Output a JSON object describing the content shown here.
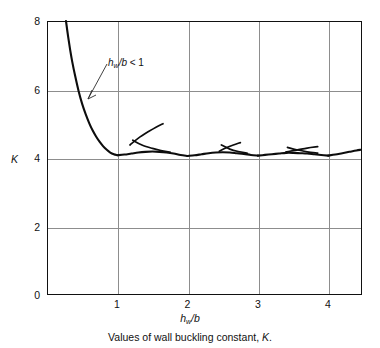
{
  "caption": {
    "prefix": "Values of wall buckling constant, ",
    "symbol": "K",
    "suffix": "."
  },
  "axes": {
    "y_title": "K",
    "x_title_main": "h",
    "x_title_sub": "w",
    "x_title_rest": "/b",
    "y_ticks": [
      "0",
      "2",
      "4",
      "6",
      "8"
    ],
    "x_ticks": [
      "1",
      "2",
      "3",
      "4"
    ]
  },
  "annotation": {
    "main": "h",
    "sub": "w",
    "rest": "/b",
    "relation": " < 1"
  },
  "chart_data": {
    "type": "line",
    "title": "Values of wall buckling constant, K.",
    "xlabel": "hw/b",
    "ylabel": "K",
    "xlim": [
      0,
      4.48
    ],
    "ylim": [
      0,
      8
    ],
    "grid": true,
    "legend": null,
    "x_ticks": [
      1,
      2,
      3,
      4
    ],
    "y_ticks": [
      0,
      2,
      4,
      6,
      8
    ],
    "annotations": [
      {
        "text": "hw/b < 1",
        "x": 0.87,
        "y": 6.55,
        "arrow_to_x": 0.52,
        "arrow_to_y": 5.25
      }
    ],
    "series": [
      {
        "name": "envelope (minimum K, m=1)",
        "comment": "Steep descending branch from upper-left to the first minimum at hw/b = 1",
        "x": [
          0.27,
          0.3,
          0.33,
          0.36,
          0.4,
          0.45,
          0.5,
          0.55,
          0.6,
          0.65,
          0.7,
          0.75,
          0.8,
          0.85,
          0.9,
          0.95,
          1.0
        ],
        "y": [
          8.0,
          7.55,
          7.15,
          6.8,
          6.4,
          5.95,
          5.58,
          5.28,
          5.02,
          4.8,
          4.62,
          4.47,
          4.34,
          4.24,
          4.16,
          4.11,
          4.08
        ]
      },
      {
        "name": "envelope lobe m=2",
        "comment": "Shallow lobe between hw/b = 1 and 2 with minimum K near 4.06 at hw/b = 2",
        "x": [
          1.0,
          1.1,
          1.2,
          1.3,
          1.4,
          1.5,
          1.6,
          1.7,
          1.8,
          1.9,
          2.0
        ],
        "y": [
          4.08,
          4.1,
          4.13,
          4.16,
          4.18,
          4.19,
          4.18,
          4.16,
          4.13,
          4.09,
          4.06
        ]
      },
      {
        "name": "envelope lobe m=3",
        "comment": "Lobe between hw/b = 2 and 3",
        "x": [
          2.0,
          2.1,
          2.2,
          2.3,
          2.4,
          2.5,
          2.6,
          2.7,
          2.8,
          2.9,
          3.0
        ],
        "y": [
          4.06,
          4.08,
          4.11,
          4.14,
          4.16,
          4.17,
          4.16,
          4.14,
          4.12,
          4.09,
          4.07
        ]
      },
      {
        "name": "envelope lobe m=4",
        "comment": "Lobe between hw/b = 3 and 4",
        "x": [
          3.0,
          3.1,
          3.2,
          3.3,
          3.4,
          3.5,
          3.6,
          3.7,
          3.8,
          3.9,
          4.0
        ],
        "y": [
          4.07,
          4.09,
          4.11,
          4.13,
          4.15,
          4.15,
          4.14,
          4.13,
          4.11,
          4.09,
          4.07
        ]
      },
      {
        "name": "envelope lobe m=5 (tail)",
        "comment": "Final rising tail toward the right edge of the plot",
        "x": [
          4.0,
          4.1,
          4.2,
          4.3,
          4.4,
          4.46
        ],
        "y": [
          4.07,
          4.1,
          4.14,
          4.18,
          4.22,
          4.24
        ]
      },
      {
        "name": "branch m=1 crossing",
        "comment": "Rising branch crossing the envelope near hw/b = 1.35, ending about K = 5.0 at hw/b = 1.65",
        "x": [
          1.18,
          1.3,
          1.45,
          1.55,
          1.65
        ],
        "y": [
          4.38,
          4.58,
          4.78,
          4.9,
          5.0
        ]
      },
      {
        "name": "branch m=2 falling tail",
        "comment": "Short descending segment that meets the envelope after the first crossing",
        "x": [
          1.22,
          1.35,
          1.5,
          1.62,
          1.75
        ],
        "y": [
          4.52,
          4.38,
          4.28,
          4.22,
          4.17
        ]
      },
      {
        "name": "branch m=2 crossing",
        "comment": "Rising branch crossing the envelope near hw/b = 2.6",
        "x": [
          2.45,
          2.55,
          2.65,
          2.75
        ],
        "y": [
          4.2,
          4.3,
          4.38,
          4.45
        ]
      },
      {
        "name": "branch m=3 falling tail",
        "comment": "Descending segment through the second crossing",
        "x": [
          2.48,
          2.6,
          2.72,
          2.85
        ],
        "y": [
          4.38,
          4.26,
          4.19,
          4.14
        ]
      },
      {
        "name": "branch m=3 crossing",
        "comment": "Rising branch crossing the envelope near hw/b = 3.6",
        "x": [
          3.4,
          3.55,
          3.7,
          3.85
        ],
        "y": [
          4.18,
          4.23,
          4.29,
          4.33
        ]
      },
      {
        "name": "branch m=4 falling tail",
        "comment": "Descending segment through the third crossing",
        "x": [
          3.42,
          3.55,
          3.7,
          3.85
        ],
        "y": [
          4.31,
          4.24,
          4.18,
          4.14
        ]
      }
    ]
  }
}
